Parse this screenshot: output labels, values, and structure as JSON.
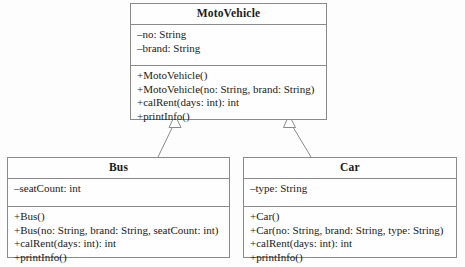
{
  "diagram": {
    "type": "uml-class-diagram",
    "background_color": "#fdfdfd",
    "line_color": "#8a8a8a",
    "text_color": "#1a1a1a"
  },
  "classes": {
    "motovehicle": {
      "name": "MotoVehicle",
      "attributes": [
        "–no: String",
        "–brand: String"
      ],
      "methods": [
        "+MotoVehicle()",
        "+MotoVehicle(no: String, brand: String)",
        "+calRent(days: int): int",
        "+printInfo()"
      ]
    },
    "bus": {
      "name": "Bus",
      "attributes": [
        "–seatCount: int"
      ],
      "methods": [
        "+Bus()",
        "+Bus(no: String, brand: String, seatCount: int)",
        "+calRent(days: int): int",
        "+printInfo()"
      ]
    },
    "car": {
      "name": "Car",
      "attributes": [
        "–type: String"
      ],
      "methods": [
        "+Car()",
        "+Car(no: String, brand: String, type: String)",
        "+calRent(days: int): int",
        "+printInfo()"
      ]
    }
  },
  "relationships": [
    {
      "kind": "generalization",
      "from": "bus",
      "to": "motovehicle",
      "arrow": "hollow-triangle"
    },
    {
      "kind": "generalization",
      "from": "car",
      "to": "motovehicle",
      "arrow": "hollow-triangle"
    }
  ]
}
